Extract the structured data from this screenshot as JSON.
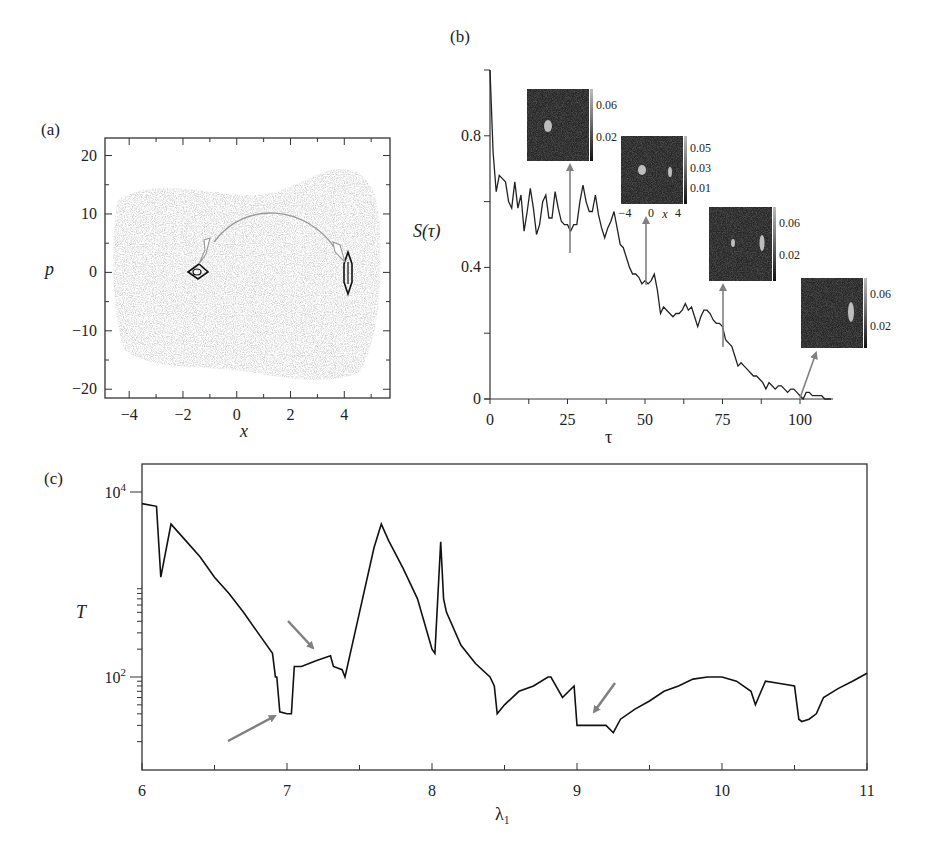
{
  "panels": {
    "a": {
      "label": "(a)",
      "xlabel": "x",
      "ylabel": "p"
    },
    "b": {
      "label": "(b)",
      "xlabel": "τ",
      "ylabel": "S(τ)"
    },
    "c": {
      "label": "(c)",
      "xlabel": "λ₁",
      "ylabel": "T"
    }
  },
  "colors": {
    "line": "#111111",
    "arrow": "#808080",
    "scatter": "#b8b8b8",
    "inset_bg": "#262626"
  },
  "chart_data": [
    {
      "id": "a",
      "type": "scatter",
      "title": "(a)",
      "xlabel": "x",
      "ylabel": "p",
      "xlim": [
        -4.9,
        5.7
      ],
      "ylim": [
        -21.5,
        23
      ],
      "xticks": [
        -4,
        -2,
        0,
        2,
        4
      ],
      "yticks": [
        -20,
        -10,
        0,
        10,
        20
      ],
      "annotations": [
        {
          "type": "contour",
          "center": [
            -1.6,
            0
          ],
          "desc": "small diamond-shaped contour near x=-1.6, p=0"
        },
        {
          "type": "contour",
          "center": [
            4.1,
            0
          ],
          "desc": "narrow vertical elliptical contour near x=4.1, p=0"
        },
        {
          "type": "arc-arrow",
          "from": [
            -1.5,
            2.5
          ],
          "to": [
            3.8,
            1.5
          ],
          "peak": [
            1.2,
            10.5
          ],
          "desc": "double-headed arc between the two contours"
        }
      ],
      "background": "grey speckled chaotic sea covering x≈-4.5..5.3, p≈-18..18"
    },
    {
      "id": "b",
      "type": "line",
      "title": "(b)",
      "xlabel": "τ",
      "ylabel": "S(τ)",
      "xlim": [
        0,
        110
      ],
      "ylim": [
        0,
        1.0
      ],
      "xticks": [
        0,
        25,
        50,
        75,
        100
      ],
      "yticks": [
        0,
        0.4,
        0.8
      ],
      "x": [
        0,
        1,
        2,
        3,
        4,
        5,
        6,
        7,
        8,
        9,
        10,
        11,
        12,
        13,
        14,
        15,
        16,
        17,
        18,
        19,
        20,
        21,
        22,
        23,
        24,
        25,
        26,
        27,
        28,
        29,
        30,
        31,
        32,
        33,
        34,
        35,
        36,
        37,
        38,
        39,
        40,
        41,
        42,
        43,
        44,
        45,
        46,
        47,
        48,
        49,
        50,
        51,
        52,
        53,
        54,
        55,
        56,
        57,
        58,
        59,
        60,
        61,
        62,
        63,
        64,
        65,
        66,
        67,
        68,
        69,
        70,
        71,
        72,
        73,
        74,
        75,
        76,
        77,
        78,
        79,
        80,
        81,
        82,
        83,
        84,
        85,
        86,
        87,
        88,
        89,
        90,
        91,
        92,
        93,
        94,
        95,
        96,
        97,
        98,
        99,
        100,
        101,
        102,
        103,
        104,
        105,
        106,
        107,
        108,
        109,
        110
      ],
      "values": [
        1.0,
        0.75,
        0.63,
        0.68,
        0.67,
        0.66,
        0.6,
        0.58,
        0.66,
        0.58,
        0.62,
        0.51,
        0.57,
        0.64,
        0.58,
        0.5,
        0.53,
        0.6,
        0.62,
        0.55,
        0.55,
        0.63,
        0.58,
        0.54,
        0.53,
        0.53,
        0.51,
        0.53,
        0.53,
        0.6,
        0.65,
        0.6,
        0.57,
        0.57,
        0.62,
        0.56,
        0.52,
        0.49,
        0.52,
        0.54,
        0.57,
        0.52,
        0.47,
        0.46,
        0.43,
        0.4,
        0.38,
        0.38,
        0.37,
        0.35,
        0.36,
        0.35,
        0.36,
        0.38,
        0.33,
        0.26,
        0.28,
        0.27,
        0.26,
        0.25,
        0.26,
        0.26,
        0.27,
        0.29,
        0.27,
        0.28,
        0.25,
        0.22,
        0.25,
        0.27,
        0.27,
        0.26,
        0.24,
        0.23,
        0.23,
        0.22,
        0.18,
        0.17,
        0.16,
        0.13,
        0.1,
        0.11,
        0.1,
        0.09,
        0.08,
        0.07,
        0.07,
        0.06,
        0.05,
        0.03,
        0.05,
        0.04,
        0.03,
        0.04,
        0.04,
        0.03,
        0.02,
        0.03,
        0.03,
        0.02,
        0.01,
        0.0,
        0.02,
        0.02,
        0.01,
        0.01,
        0.01,
        0.01,
        0.0,
        0.0,
        0.0
      ],
      "insets": [
        {
          "at_tau": 26,
          "colorbar_ticks": [
            "0.06",
            "0.02"
          ]
        },
        {
          "at_tau": 51,
          "colorbar_ticks": [
            "0.05",
            "0.03",
            "0.01"
          ],
          "xticks": [
            "-4",
            "0",
            "4"
          ],
          "xlabel": "x"
        },
        {
          "at_tau": 76,
          "colorbar_ticks": [
            "0.06",
            "0.02"
          ]
        },
        {
          "at_tau": 101,
          "colorbar_ticks": [
            "0.06",
            "0.02"
          ]
        }
      ]
    },
    {
      "id": "c",
      "type": "line",
      "title": "(c)",
      "xlabel": "λ₁",
      "ylabel": "T",
      "xlim": [
        6,
        11
      ],
      "ylim": [
        3,
        30000
      ],
      "yscale": "log",
      "xticks": [
        6,
        7,
        8,
        9,
        10,
        11
      ],
      "yticks": [
        "10^2",
        "10^4"
      ],
      "x": [
        6.0,
        6.1,
        6.13,
        6.2,
        6.3,
        6.4,
        6.5,
        6.6,
        6.7,
        6.8,
        6.9,
        6.92,
        6.93,
        6.95,
        7.0,
        7.03,
        7.05,
        7.1,
        7.2,
        7.3,
        7.32,
        7.38,
        7.4,
        7.5,
        7.6,
        7.65,
        7.7,
        7.8,
        7.9,
        8.0,
        8.02,
        8.06,
        8.08,
        8.1,
        8.2,
        8.3,
        8.4,
        8.43,
        8.45,
        8.5,
        8.6,
        8.7,
        8.8,
        8.82,
        8.9,
        8.98,
        9.0,
        9.1,
        9.2,
        9.25,
        9.3,
        9.4,
        9.5,
        9.6,
        9.7,
        9.8,
        9.9,
        10.0,
        10.1,
        10.2,
        10.23,
        10.27,
        10.3,
        10.4,
        10.5,
        10.53,
        10.55,
        10.6,
        10.65,
        10.7,
        10.8,
        10.9,
        11.0
      ],
      "values": [
        7500,
        7000,
        1200,
        4500,
        3000,
        2000,
        1200,
        800,
        500,
        300,
        180,
        100,
        100,
        42,
        40,
        40,
        130,
        130,
        150,
        170,
        130,
        120,
        100,
        500,
        2500,
        4500,
        3000,
        1500,
        700,
        200,
        180,
        2900,
        700,
        500,
        220,
        140,
        100,
        80,
        40,
        50,
        70,
        80,
        100,
        100,
        60,
        80,
        30,
        30,
        30,
        25,
        35,
        45,
        55,
        70,
        80,
        95,
        100,
        100,
        90,
        70,
        50,
        70,
        90,
        85,
        80,
        35,
        33,
        35,
        40,
        60,
        75,
        90,
        110
      ]
    }
  ]
}
